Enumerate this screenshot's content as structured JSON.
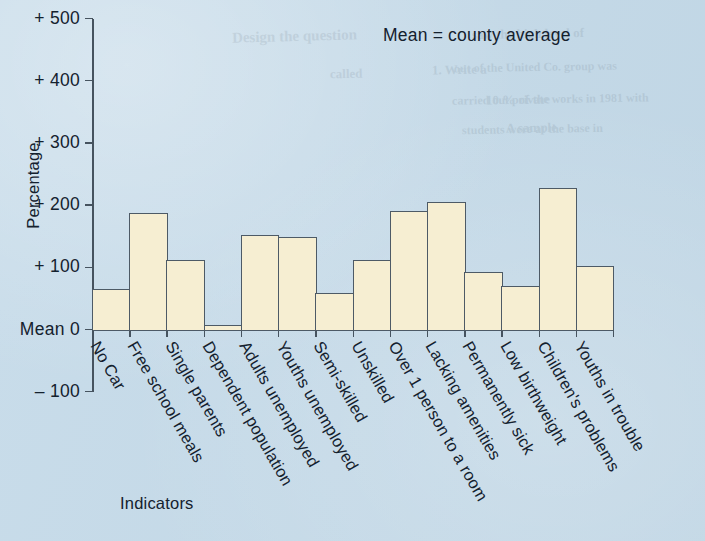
{
  "annotation": {
    "mean_note": "Mean  =  county average"
  },
  "axis": {
    "y_title": "Percentage",
    "x_title": "Indicators",
    "y_tick_labels": [
      "+ 500",
      "+ 400",
      "+ 300",
      "+ 200",
      "+ 100",
      "Mean  0",
      "– 100"
    ],
    "zero_label": "Mean  0"
  },
  "colors": {
    "background": "#c3d9e8",
    "bar_fill": "#f6eed2",
    "bar_stroke": "#4d5a66",
    "axis": "#46535f",
    "text": "#14212e"
  },
  "ghost_text": [
    {
      "text": "Design the question",
      "left": 232,
      "top": 28,
      "size": 15,
      "rot": -1.5
    },
    {
      "text": "saw the high level of",
      "left": 472,
      "top": 26,
      "size": 13,
      "rot": -1.0
    },
    {
      "text": "1. Write a",
      "left": 432,
      "top": 62,
      "size": 13,
      "rot": -1.0
    },
    {
      "text": "out of the United Co. group was",
      "left": 454,
      "top": 60,
      "size": 12,
      "rot": -1.0
    },
    {
      "text": "called",
      "left": 330,
      "top": 66,
      "size": 13,
      "rot": -1.0
    },
    {
      "text": "10 % of the",
      "left": 486,
      "top": 92,
      "size": 13,
      "rot": -1.0
    },
    {
      "text": "carried out private works in 1981 with",
      "left": 452,
      "top": 92,
      "size": 12,
      "rot": -1.0
    },
    {
      "text": "A sample",
      "left": 506,
      "top": 120,
      "size": 13,
      "rot": -1.0
    },
    {
      "text": "students were at the base in",
      "left": 462,
      "top": 122,
      "size": 12,
      "rot": -1.0
    }
  ],
  "chart_data": {
    "type": "bar",
    "title": "",
    "subtitle": "",
    "annotation": "Mean = county average",
    "xlabel": "Indicators",
    "ylabel": "Percentage",
    "ylim": [
      -100,
      500
    ],
    "yticks": [
      -100,
      0,
      100,
      200,
      300,
      400,
      500
    ],
    "ytick_labels": [
      "– 100",
      "Mean 0",
      "+ 100",
      "+ 200",
      "+ 300",
      "+ 400",
      "+ 500"
    ],
    "grid": false,
    "legend": "none",
    "baseline": 0,
    "baseline_label": "Mean",
    "categories": [
      "No Car",
      "Free school meals",
      "Single parents",
      "Dependent population",
      "Adults unemployed",
      "Youths unemployed",
      "Semi-skilled",
      "Unskilled",
      "Over 1 person to a room",
      "Lacking amenities",
      "Permanently sick",
      "Low birthweight",
      "Children's problems",
      "Youths in trouble"
    ],
    "values": [
      65,
      188,
      112,
      8,
      152,
      148,
      58,
      112,
      190,
      205,
      93,
      70,
      227,
      102
    ]
  }
}
